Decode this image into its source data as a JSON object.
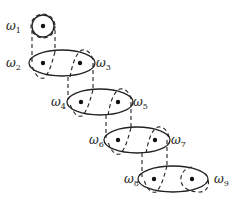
{
  "diagram": {
    "type": "chain of ellipses with dashed connectors",
    "nodes": [
      {
        "id": "w1",
        "label": "ω",
        "sub": "1",
        "x": 22,
        "y": 30
      },
      {
        "id": "w2",
        "label": "ω",
        "sub": "2",
        "x": 14,
        "y": 67
      },
      {
        "id": "w3",
        "label": "ω",
        "sub": "3",
        "x": 97,
        "y": 67
      },
      {
        "id": "w4",
        "label": "ω",
        "sub": "4",
        "x": 50,
        "y": 106
      },
      {
        "id": "w5",
        "label": "ω",
        "sub": "5",
        "x": 131,
        "y": 106
      },
      {
        "id": "w6",
        "label": "ω",
        "sub": "6",
        "x": 88,
        "y": 145
      },
      {
        "id": "w7",
        "label": "ω",
        "sub": "7",
        "x": 171,
        "y": 145
      },
      {
        "id": "w8",
        "label": "ω",
        "sub": "8",
        "x": 124,
        "y": 184
      },
      {
        "id": "w9",
        "label": "ω",
        "sub": "9",
        "x": 214,
        "y": 184
      }
    ]
  }
}
